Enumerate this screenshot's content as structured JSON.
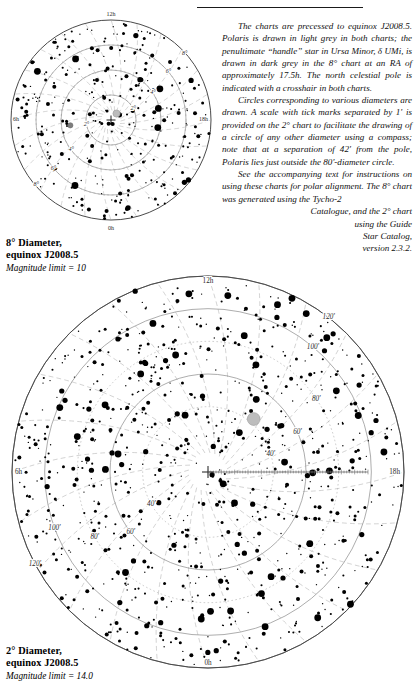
{
  "document": {
    "type": "polar-alignment-star-charts",
    "rule_present": true
  },
  "body_text": {
    "paragraph_1": "The charts are precessed to equinox J2008.5. Polaris is drawn in light grey in both charts; the penultimate “handle” star in Ursa Minor, δ UMi, is drawn in dark grey in the 8° chart at an RA of approximately 17.5h. The north celestial pole is indicated with a crosshair in both charts.",
    "paragraph_2": "Circles corresponding to various diameters are drawn. A scale with tick marks separated by 1' is provided on the 2° chart to facilitate the drawing of a circle of any other diameter using a compass; note that at a separation of 42' from the pole, Polaris lies just outside the 80'-diameter circle.",
    "paragraph_3_main": "See the accompanying text for instructions on using these charts for polar alignment. The 8° chart was generated using the Tycho-2",
    "paragraph_3_tail_1": "Catalogue, and the 2° chart",
    "paragraph_3_tail_2": "using the Guide",
    "paragraph_3_tail_3": "Star Catalog,",
    "paragraph_3_tail_4": "version 2.3.2."
  },
  "chart_8deg": {
    "caption_line1": "8° Diameter,",
    "caption_line2": "equinox J2008.5",
    "caption_line3": "Magnitude limit = 10",
    "ra_labels": [
      "12h",
      "6h",
      "18h",
      "0h"
    ],
    "ring_labels_upper_right": [
      "8°",
      "6°",
      "4°",
      "2°"
    ],
    "ring_labels_lower_left": [
      "2°",
      "4°",
      "6°",
      "8°"
    ],
    "ring_values_deg": [
      2,
      4,
      6,
      8
    ],
    "polaris_color": "#b9b9b9",
    "delta_umi_color": "#7a7a7a",
    "pole_marker": "crosshair"
  },
  "chart_2deg": {
    "caption_line1": "2° Diameter,",
    "caption_line2": "equinox J2008.5",
    "caption_line3": "Magnitude limit = 14.0",
    "ra_labels": [
      "12h",
      "6h",
      "18h",
      "0h"
    ],
    "ring_labels_upper_right": [
      "120'",
      "100'",
      "80'",
      "60'",
      "40'"
    ],
    "ring_labels_lower_left": [
      "40'",
      "60'",
      "80'",
      "100'",
      "120'"
    ],
    "ring_values_arcmin": [
      40,
      60,
      80,
      100,
      120
    ],
    "polaris_color": "#b9b9b9",
    "pole_marker": "crosshair",
    "scale_bar": {
      "tick_separation": "1'",
      "direction": "east"
    }
  },
  "chart_data": [
    {
      "type": "scatter",
      "title": "8° Diameter, equinox J2008.5",
      "subtitle": "Magnitude limit = 10",
      "projection": "polar-north-celestial-pole",
      "radial_axis": {
        "label": "angular distance from pole",
        "unit": "degrees",
        "ticks": [
          2,
          4,
          6,
          8
        ],
        "max": 8
      },
      "angular_axis": {
        "label": "right ascension",
        "unit": "hours",
        "ticks": [
          0,
          6,
          12,
          18
        ],
        "tick_labels": [
          "0h",
          "6h",
          "12h",
          "18h"
        ]
      },
      "grid": true,
      "annotations": [
        {
          "name": "Polaris",
          "color": "#b9b9b9",
          "r_deg": 0.7,
          "ra_h": 2.7
        },
        {
          "name": "δ UMi",
          "color": "#7a7a7a",
          "r_deg": 3.3,
          "ra_h": 17.5
        },
        {
          "name": "north celestial pole",
          "marker": "crosshair",
          "r_deg": 0,
          "ra_h": 0
        }
      ]
    },
    {
      "type": "scatter",
      "title": "2° Diameter, equinox J2008.5",
      "subtitle": "Magnitude limit = 14.0",
      "projection": "polar-north-celestial-pole",
      "radial_axis": {
        "label": "angular distance from pole",
        "unit": "arcminutes",
        "ticks": [
          40,
          60,
          80,
          100,
          120
        ],
        "max": 120
      },
      "angular_axis": {
        "label": "right ascension",
        "unit": "hours",
        "ticks": [
          0,
          6,
          12,
          18
        ],
        "tick_labels": [
          "0h",
          "6h",
          "12h",
          "18h"
        ]
      },
      "grid": true,
      "annotations": [
        {
          "name": "Polaris",
          "color": "#b9b9b9",
          "r_arcmin": 42,
          "ra_h": 2.7
        },
        {
          "name": "north celestial pole",
          "marker": "crosshair",
          "r_arcmin": 0,
          "ra_h": 0
        },
        {
          "name": "scale bar",
          "tick_separation_arcmin": 1,
          "direction": "east"
        }
      ]
    }
  ]
}
